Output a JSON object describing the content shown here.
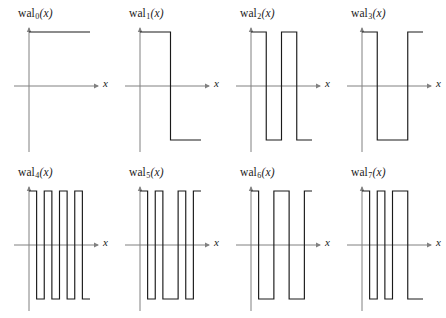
{
  "figure": {
    "columns": 4,
    "rows": 2,
    "axis_color": "#808080",
    "curve_color": "#1a1a1a",
    "background": "#ffffff",
    "x_axis_label": "x",
    "function_name": "wal"
  },
  "chart_data": {
    "type": "line",
    "xlabel": "x",
    "ylabel": "",
    "xlim": [
      0,
      1
    ],
    "ylim": [
      -1.35,
      1.35
    ],
    "grid": false,
    "legend": "none",
    "note": "Each panel is a square wave taking values +1 and -1 on [0,1]; step sequences given as per-subinterval values in sequency (Walsh) order.",
    "panels": [
      {
        "index": 0,
        "label_base": "wal",
        "label_sub": "0",
        "label_arg": "(x)",
        "xlabel": "x",
        "segments": 1,
        "values": [
          1
        ],
        "breakpoints": [
          0,
          1
        ]
      },
      {
        "index": 1,
        "label_base": "wal",
        "label_sub": "1",
        "label_arg": "(x)",
        "xlabel": "x",
        "segments": 2,
        "values": [
          1,
          -1
        ],
        "breakpoints": [
          0,
          0.5,
          1
        ]
      },
      {
        "index": 2,
        "label_base": "wal",
        "label_sub": "2",
        "label_arg": "(x)",
        "xlabel": "x",
        "segments": 4,
        "values": [
          1,
          -1,
          1,
          -1
        ],
        "breakpoints": [
          0,
          0.25,
          0.5,
          0.75,
          1
        ]
      },
      {
        "index": 3,
        "label_base": "wal",
        "label_sub": "3",
        "label_arg": "(x)",
        "xlabel": "x",
        "segments": 3,
        "values": [
          1,
          -1,
          1
        ],
        "breakpoints": [
          0,
          0.25,
          0.75,
          1
        ]
      },
      {
        "index": 4,
        "label_base": "wal",
        "label_sub": "4",
        "label_arg": "(x)",
        "xlabel": "x",
        "segments": 8,
        "values": [
          1,
          -1,
          1,
          -1,
          1,
          -1,
          1,
          -1
        ],
        "breakpoints": [
          0,
          0.125,
          0.25,
          0.375,
          0.5,
          0.625,
          0.75,
          0.875,
          1
        ]
      },
      {
        "index": 5,
        "label_base": "wal",
        "label_sub": "5",
        "label_arg": "(x)",
        "xlabel": "x",
        "segments": 7,
        "values": [
          1,
          -1,
          1,
          -1,
          1,
          -1,
          1
        ],
        "breakpoints": [
          0,
          0.125,
          0.25,
          0.375,
          0.625,
          0.75,
          0.875,
          1
        ]
      },
      {
        "index": 6,
        "label_base": "wal",
        "label_sub": "6",
        "label_arg": "(x)",
        "xlabel": "x",
        "segments": 5,
        "values": [
          1,
          -1,
          1,
          -1,
          1
        ],
        "breakpoints": [
          0,
          0.125,
          0.375,
          0.625,
          0.875,
          1
        ]
      },
      {
        "index": 7,
        "label_base": "wal",
        "label_sub": "7",
        "label_arg": "(x)",
        "xlabel": "x",
        "segments": 6,
        "values": [
          1,
          -1,
          1,
          -1,
          1,
          -1
        ],
        "breakpoints": [
          0,
          0.125,
          0.25,
          0.375,
          0.5,
          0.75,
          1
        ]
      }
    ]
  }
}
